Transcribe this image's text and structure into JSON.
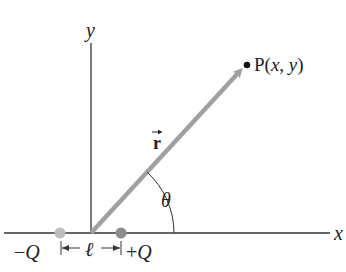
{
  "diagram": {
    "axes": {
      "x_label": "x",
      "y_label": "y"
    },
    "point": {
      "label_prefix": "P(",
      "label_x": "x",
      "label_sep": ", ",
      "label_y": "y",
      "label_suffix": ")"
    },
    "vector": {
      "label": "r"
    },
    "angle": {
      "label": "θ"
    },
    "charges": {
      "negative": {
        "sign": "−",
        "symbol": "Q"
      },
      "positive": {
        "sign": "+",
        "symbol": "Q"
      }
    },
    "separation": {
      "label": "ℓ"
    },
    "colors": {
      "axis": "#333333",
      "vector": "#a0a0a0",
      "negative_charge": "#bdbdbd",
      "positive_charge": "#8c8c8c",
      "point": "#111111",
      "text": "#222222"
    }
  }
}
